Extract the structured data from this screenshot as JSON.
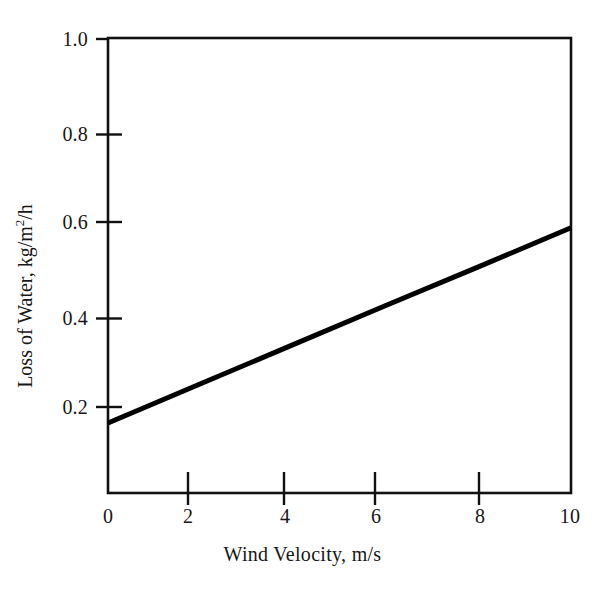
{
  "chart_data": {
    "type": "line",
    "title": "",
    "subtitle": "",
    "xlabel": "Wind Velocity, m/s",
    "ylabel_text": "Loss of Water, kg/m",
    "ylabel_sup": "2",
    "ylabel_tail": "/h",
    "ylabel_full": "Loss of Water, kg/m2/h",
    "xlim": [
      0,
      10
    ],
    "ylim": [
      0,
      1.0
    ],
    "xticks": [
      0,
      2,
      4,
      6,
      8,
      10
    ],
    "xtick_labels": [
      "0",
      "2",
      "4",
      "6",
      "8",
      "10"
    ],
    "yticks": [
      0.2,
      0.4,
      0.6,
      0.8,
      1.0
    ],
    "ytick_labels": [
      "0.2",
      "0.4",
      "0.6",
      "0.8",
      "1.0"
    ],
    "grid": false,
    "legend": "none",
    "series": [
      {
        "name": "Loss of Water vs Wind Velocity",
        "x": [
          0,
          2,
          4,
          6,
          8,
          10
        ],
        "values": [
          0.154,
          0.24,
          0.326,
          0.412,
          0.497,
          0.583
        ],
        "color": "#000000",
        "line_width": 5
      }
    ],
    "frame_color": "#111111",
    "background": "#ffffff"
  },
  "figure": {
    "axis_line_color": "#111111",
    "tick_color": "#111111"
  }
}
